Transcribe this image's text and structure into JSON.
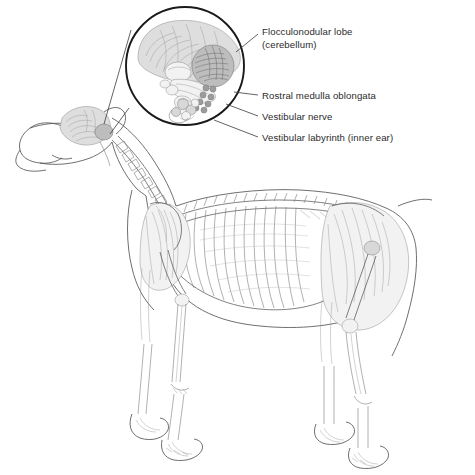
{
  "figure": {
    "kind": "veterinary-anatomy-illustration",
    "background_color": "#ffffff",
    "line_color": "#6f6f6f",
    "text_color": "#2b2b2b",
    "inset": {
      "shape": "circle",
      "name": "brain-magnification-inset",
      "center_x": 185,
      "center_y": 66,
      "radius": 60,
      "ring_color": "#1a1a1a",
      "source_region": "dog-head-brain"
    }
  },
  "labels": [
    {
      "id": "flocculonodular-lobe",
      "line1": "Flocculonodular lobe",
      "line2": "(cerebellum)",
      "text_x": 262,
      "text_y": 38,
      "leader_from_x": 236,
      "leader_from_y": 52,
      "leader_to_x": 258,
      "leader_to_y": 34
    },
    {
      "id": "rostral-medulla-oblongata",
      "line1": "Rostral medulla oblongata",
      "line2": "",
      "text_x": 262,
      "text_y": 99,
      "leader_from_x": 234,
      "leader_from_y": 92,
      "leader_to_x": 258,
      "leader_to_y": 95
    },
    {
      "id": "vestibular-nerve",
      "line1": "Vestibular nerve",
      "line2": "",
      "text_x": 262,
      "text_y": 120,
      "leader_from_x": 226,
      "leader_from_y": 104,
      "leader_to_x": 258,
      "leader_to_y": 116
    },
    {
      "id": "vestibular-labyrinth",
      "line1": "Vestibular labyrinth (inner ear)",
      "line2": "",
      "text_x": 262,
      "text_y": 141,
      "leader_from_x": 214,
      "leader_from_y": 120,
      "leader_to_x": 258,
      "leader_to_y": 137
    }
  ],
  "inset_structures": [
    {
      "id": "cerebrum",
      "label": "cerebrum"
    },
    {
      "id": "cerebellum",
      "label": "flocculonodular lobe (cerebellum)"
    },
    {
      "id": "medulla",
      "label": "rostral medulla oblongata"
    },
    {
      "id": "vestibular-nerve-fibers",
      "label": "vestibular nerve"
    },
    {
      "id": "labyrinth",
      "label": "vestibular labyrinth (inner ear)"
    }
  ],
  "dog_parts": [
    {
      "id": "head",
      "label": "head"
    },
    {
      "id": "brain-highlight",
      "label": "brain"
    },
    {
      "id": "spine",
      "label": "vertebral column"
    },
    {
      "id": "ribcage",
      "label": "ribcage"
    },
    {
      "id": "forelimb",
      "label": "forelimb"
    },
    {
      "id": "hindlimb",
      "label": "hindlimb"
    },
    {
      "id": "body-outline",
      "label": "body outline"
    }
  ]
}
